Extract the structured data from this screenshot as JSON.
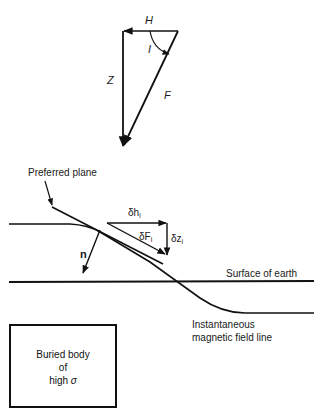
{
  "vector_triangle": {
    "labels": {
      "horizontal": "H",
      "inclination": "I",
      "vertical": "Z",
      "total": "F"
    }
  },
  "field_diagram": {
    "preferred_plane_label": "Preferred plane",
    "normal_label": "n",
    "dh_label": "δh",
    "dh_sub": "i",
    "dF_label": "δF",
    "dF_sub": "i",
    "dz_label": "δz",
    "dz_sub": "i",
    "surface_label": "Surface of earth",
    "field_line_label_1": "Instantaneous",
    "field_line_label_2": "magnetic field line"
  },
  "buried_body": {
    "line1": "Buried body",
    "line2": "of",
    "line3_prefix": "high ",
    "line3_symbol": "σ"
  },
  "colors": {
    "ink": "#111111",
    "background": "#ffffff"
  }
}
